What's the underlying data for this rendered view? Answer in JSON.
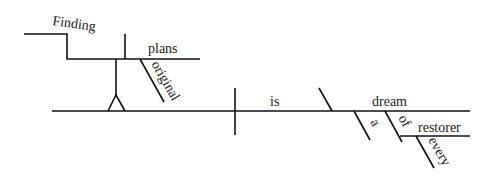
{
  "diagram": {
    "type": "sentence-diagram",
    "sentence": "Finding original plans is every restorer's dream",
    "words": {
      "gerund": "Finding",
      "gerund_object": "plans",
      "gerund_object_modifier": "original",
      "verb": "is",
      "predicate_nominative": "dream",
      "article": "a",
      "preposition": "of",
      "prepositional_object": "restorer",
      "prepositional_object_modifier": "every"
    },
    "line_color": "#111111",
    "background": "#ffffff"
  }
}
